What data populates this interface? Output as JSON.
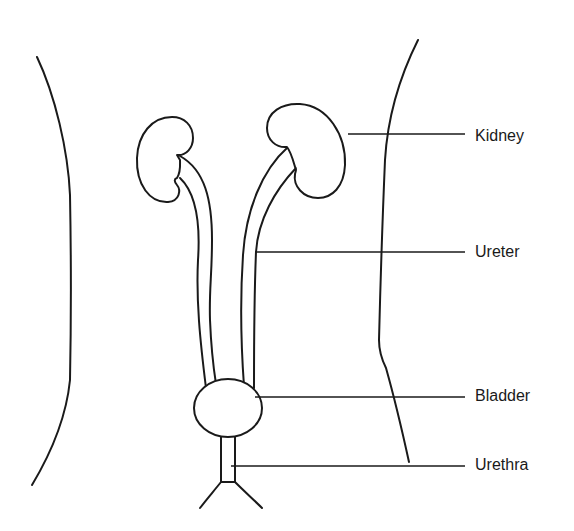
{
  "diagram": {
    "type": "anatomical-labeled-line-drawing",
    "colors": {
      "line": "#1a1a1a",
      "background": "#ffffff"
    },
    "labels": [
      {
        "id": "kidney",
        "text": "Kidney",
        "y": 137
      },
      {
        "id": "ureter",
        "text": "Ureter",
        "y": 252
      },
      {
        "id": "bladder",
        "text": "Bladder",
        "y": 397
      },
      {
        "id": "urethra",
        "text": "Urethra",
        "y": 465
      }
    ]
  }
}
